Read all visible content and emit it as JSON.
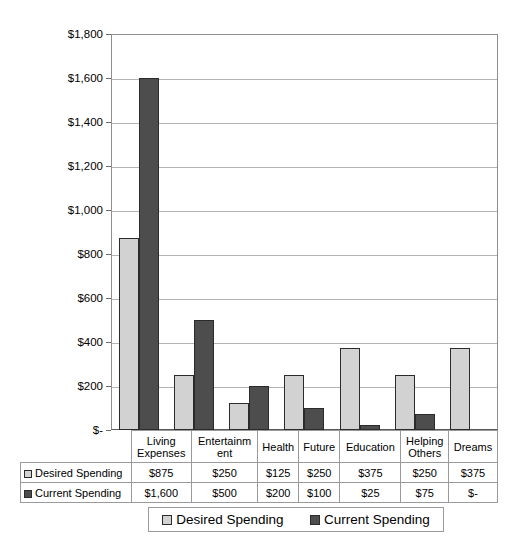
{
  "chart_data": {
    "type": "bar",
    "title": "",
    "xlabel": "",
    "ylabel": "",
    "ylim": [
      0,
      1800
    ],
    "ytick_step": 200,
    "grid": true,
    "legend_position": "bottom",
    "categories": [
      "Living Expenses",
      "Entertainment",
      "Health",
      "Future",
      "Education",
      "Helping Others",
      "Dreams"
    ],
    "category_labels": [
      "Living\nExpenses",
      "Entertainm\nent",
      "Health",
      "Future",
      "Education",
      "Helping\nOthers",
      "Dreams"
    ],
    "ytick_labels": [
      "$1,800",
      "$1,600",
      "$1,400",
      "$1,200",
      "$1,000",
      "$800",
      "$600",
      "$400",
      "$200",
      "$-"
    ],
    "ytick_values": [
      1800,
      1600,
      1400,
      1200,
      1000,
      800,
      600,
      400,
      200,
      0
    ],
    "series": [
      {
        "name": "Desired Spending",
        "color": "#d2d2d2",
        "values": [
          875,
          250,
          125,
          250,
          375,
          250,
          375
        ],
        "value_labels": [
          "$875",
          "$250",
          "$125",
          "$250",
          "$375",
          "$250",
          "$375"
        ]
      },
      {
        "name": "Current Spending",
        "color": "#4d4d4d",
        "values": [
          1600,
          500,
          200,
          100,
          25,
          75,
          0
        ],
        "value_labels": [
          "$1,600",
          "$500",
          "$200",
          "$100",
          "$25",
          "$75",
          "$-"
        ]
      }
    ]
  },
  "legend": {
    "entries": [
      {
        "label": "Desired Spending",
        "swatch": "desired"
      },
      {
        "label": "Current Spending",
        "swatch": "current"
      }
    ]
  },
  "data_table": {
    "row_headers": [
      "Desired Spending",
      "Current Spending"
    ]
  }
}
